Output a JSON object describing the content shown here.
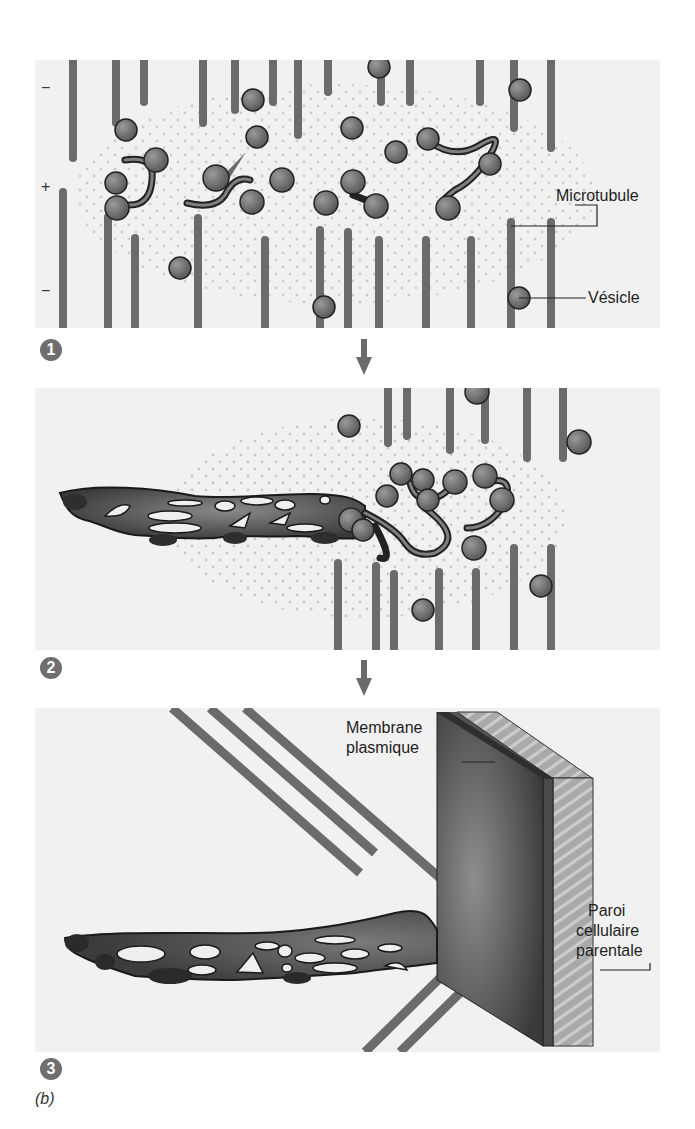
{
  "figure": {
    "caption": "(b)",
    "colors": {
      "panel_bg": "#f1f1f1",
      "microtubule": "#6b6b6b",
      "vesicle": "#707070",
      "vesicle_outline": "#222222",
      "phragmoplast": "#4a4a4a",
      "membrane": "#3f3f3f",
      "wall": "#b5b5b5",
      "badge": "#6e6e6e",
      "arrow": "#6b6b6b"
    },
    "panels": [
      {
        "step": "1",
        "polarity_labels": {
          "top": "−",
          "middle": "+",
          "bottom": "−"
        },
        "labels": {
          "microtubule": "Microtubule",
          "vesicle": "Vésicle"
        }
      },
      {
        "step": "2"
      },
      {
        "step": "3",
        "labels": {
          "membrane_line1": "Membrane",
          "membrane_line2": "plasmique",
          "wall_line1": "Paroi",
          "wall_line2": "cellulaire",
          "wall_line3": "parentale"
        }
      }
    ]
  }
}
